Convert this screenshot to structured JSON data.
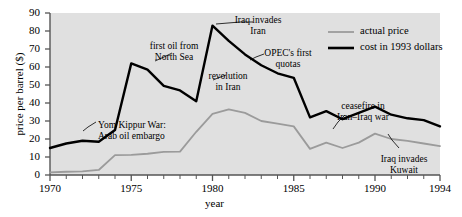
{
  "chart_data": {
    "type": "line",
    "title": "",
    "xlabel": "year",
    "ylabel": "price per barrel ($)",
    "xlim": [
      1970,
      1994
    ],
    "ylim": [
      0,
      90
    ],
    "xticks": [
      1970,
      1975,
      1980,
      1985,
      1990,
      1994
    ],
    "xtick_labels": [
      "1970",
      "1975",
      "1980",
      "1985",
      "1990",
      "1994"
    ],
    "yticks": [
      0,
      10,
      20,
      30,
      40,
      50,
      60,
      70,
      80,
      90
    ],
    "ytick_labels": [
      "0",
      "10",
      "20",
      "30",
      "40",
      "50",
      "60",
      "70",
      "80",
      "90"
    ],
    "minor_xticks_every": 1,
    "grid": false,
    "plot_background": "#e0e0e0",
    "legend_position": "top-right",
    "x": [
      1970,
      1971,
      1972,
      1973,
      1974,
      1975,
      1976,
      1977,
      1978,
      1979,
      1980,
      1981,
      1982,
      1983,
      1984,
      1985,
      1986,
      1987,
      1988,
      1989,
      1990,
      1991,
      1992,
      1993,
      1994
    ],
    "series": [
      {
        "name": "actual price",
        "color": "#9b9b9b",
        "width": 1.8,
        "values": [
          1.5,
          1.8,
          2.0,
          2.8,
          11.0,
          11.2,
          11.8,
          12.9,
          13.0,
          24.0,
          34.0,
          36.5,
          34.5,
          30.0,
          28.5,
          27.0,
          14.5,
          18.0,
          15.0,
          18.0,
          23.0,
          20.0,
          19.0,
          17.5,
          16.0
        ]
      },
      {
        "name": "cost in 1993 dollars",
        "color": "#000000",
        "width": 2.4,
        "values": [
          15.0,
          17.5,
          19.0,
          18.5,
          25.0,
          62.0,
          58.5,
          49.5,
          47.0,
          41.0,
          83.0,
          74.5,
          67.0,
          61.0,
          56.5,
          54.0,
          32.0,
          35.5,
          31.0,
          34.5,
          38.0,
          33.5,
          31.5,
          30.5,
          27.0
        ]
      }
    ],
    "annotations": [
      {
        "id": "yom-kippur",
        "text_lines": [
          "Yom Kippur War:",
          "Arab oil embargo"
        ],
        "align": "left",
        "x": 98,
        "y": 120
      },
      {
        "id": "first-oil-north-sea",
        "text_lines": [
          "first oil from",
          "North Sea"
        ],
        "align": "center",
        "x": 174,
        "y": 41
      },
      {
        "id": "revolution-in-iran",
        "text_lines": [
          "revolution",
          "in Iran"
        ],
        "align": "center",
        "x": 228,
        "y": 71
      },
      {
        "id": "iraq-invades-iran",
        "text_lines": [
          "Iraq invades",
          "Iran"
        ],
        "align": "center",
        "x": 258,
        "y": 15
      },
      {
        "id": "opec-first-quotas",
        "text_lines": [
          "OPEC's first",
          "quotas"
        ],
        "align": "center",
        "x": 288,
        "y": 48
      },
      {
        "id": "ceasefire-iran-iraq",
        "text_lines": [
          "ceasefire in",
          "Iran–Iraq war"
        ],
        "align": "center",
        "x": 363,
        "y": 101
      },
      {
        "id": "iraq-invades-kuwait",
        "text_lines": [
          "Iraq invades",
          "Kuwait"
        ],
        "align": "center",
        "x": 404,
        "y": 154
      }
    ],
    "leader_lines": [
      {
        "id": "yom-kippur-leader",
        "points": "96,122 88,127 83,131"
      },
      {
        "id": "first-oil-north-sea-leader",
        "points": "172,53 164,57 155,61"
      },
      {
        "id": "revolution-in-iran-leader",
        "points": "226,75 218,78 213,80"
      },
      {
        "id": "iraq-invades-iran-leader",
        "points": "253,22 240,22 216,24"
      },
      {
        "id": "opec-first-quotas-leader",
        "points": "264,54 256,57 250,60"
      },
      {
        "id": "ceasefire-iran-iraq-leader",
        "points": "345,115 338,122 333,129"
      },
      {
        "id": "iraq-invades-kuwait-leader",
        "points": "399,148 392,140 388,134"
      }
    ]
  },
  "legend": {
    "entries": [
      {
        "label": "actual price",
        "color": "#9b9b9b",
        "width": 1.8
      },
      {
        "label": "cost in 1993 dollars",
        "color": "#000000",
        "width": 2.6
      }
    ]
  }
}
